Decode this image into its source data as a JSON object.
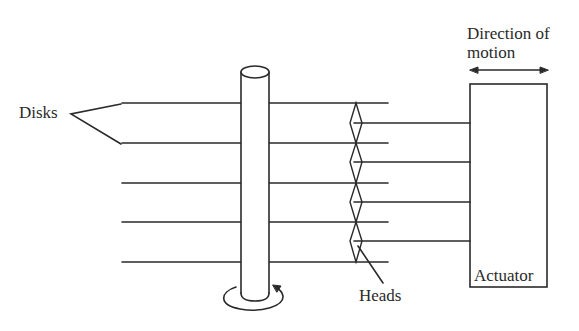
{
  "figure": {
    "type": "disk-drive-schematic",
    "colors": {
      "stroke": "#2a2a2a",
      "background": "#ffffff"
    }
  },
  "labels": {
    "disks": "Disks",
    "direction_line1": "Direction of",
    "direction_line2": "motion",
    "heads": "Heads",
    "actuator": "Actuator"
  },
  "components": {
    "disk_count": 5,
    "head_arm_count": 4,
    "spindle_rotation": "counter-clockwise arrow at base",
    "direction_arrow": "double-headed horizontal arrow"
  }
}
